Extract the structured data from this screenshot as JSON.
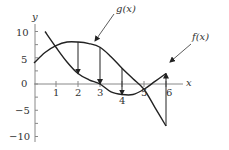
{
  "chart_data": {
    "type": "line",
    "title": "",
    "xlabel": "x",
    "ylabel": "y",
    "xlim": [
      0,
      6.5
    ],
    "ylim": [
      -10,
      11
    ],
    "x_ticks": [
      1,
      2,
      3,
      4,
      5,
      6
    ],
    "y_ticks": [
      -10,
      -5,
      0,
      5,
      10
    ],
    "grid": false,
    "series": [
      {
        "name": "g(x)",
        "x": [
          0,
          0.5,
          1,
          1.5,
          2,
          2.5,
          3,
          3.5,
          4,
          4.5,
          5,
          5.5,
          6
        ],
        "values": [
          4,
          6,
          7.3,
          8,
          8,
          7.7,
          7,
          5.2,
          3,
          1,
          -1,
          -4.5,
          -8
        ]
      },
      {
        "name": "f(x)",
        "x": [
          0.5,
          1,
          1.5,
          2,
          2.5,
          3,
          3.5,
          4,
          4.5,
          5,
          5.5,
          6
        ],
        "values": [
          10,
          7,
          4.2,
          2,
          0.8,
          0,
          -1.5,
          -2,
          -2,
          -1,
          0.5,
          2
        ]
      }
    ],
    "annotations": [
      {
        "type": "arrow",
        "x": 2,
        "from": 8,
        "to": 2
      },
      {
        "type": "arrow",
        "x": 3,
        "from": 7,
        "to": 0
      },
      {
        "type": "arrow",
        "x": 4,
        "from": 3,
        "to": -2
      },
      {
        "type": "arrow",
        "x": 6,
        "from": -8,
        "to": 2
      },
      {
        "type": "label",
        "text": "g(x)",
        "points_to": [
          2.7,
          7.6
        ]
      },
      {
        "type": "label",
        "text": "f(x)",
        "points_to": [
          5.8,
          2.5
        ]
      }
    ]
  },
  "labels": {
    "y_axis": "y",
    "x_axis": "x",
    "g_label": "g(x)",
    "f_label": "f(x)",
    "x_ticks": [
      "1",
      "2",
      "3",
      "4",
      "5",
      "6"
    ],
    "y_ticks": [
      "10",
      "5",
      "0",
      "−5",
      "−10"
    ]
  }
}
